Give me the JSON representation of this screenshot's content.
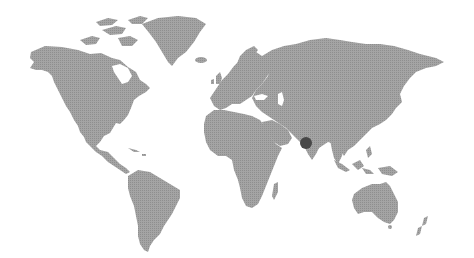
{
  "map": {
    "type": "world-map",
    "style": "dotted",
    "land_color": "#9e9e9e",
    "land_dot_color": "#8a8a8a",
    "background_color": "#ffffff",
    "marker_color": "#474747"
  },
  "markers": [
    {
      "id": "marker-1",
      "label": "",
      "x": 306,
      "y": 143,
      "r": 6,
      "region": "western India / Arabian Sea coast"
    }
  ]
}
